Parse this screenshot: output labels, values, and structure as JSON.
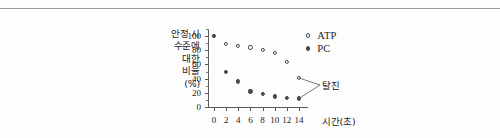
{
  "figure": {
    "y_axis_caption_lines": [
      "안정 시",
      "수준에",
      "대한",
      "비율",
      "(%)"
    ],
    "x_axis_caption": "시간(초)",
    "annotation": "탈진"
  },
  "legend": {
    "position": "top-right",
    "entries": [
      {
        "label": "ATP",
        "marker": "open-circle"
      },
      {
        "label": "PC",
        "marker": "filled-circle"
      }
    ]
  },
  "chart_data": {
    "type": "scatter",
    "title": "",
    "subtitle": "",
    "xlabel": "시간(초)",
    "ylabel": "안정 시 수준에 대한 비율 (%)",
    "xlim": [
      -1,
      15.5
    ],
    "ylim": [
      0,
      110
    ],
    "xticks": [
      0,
      2,
      4,
      6,
      8,
      10,
      12,
      14
    ],
    "xtick_labels": [
      "0",
      "2",
      "4",
      "6",
      "8",
      "10",
      "12",
      "14"
    ],
    "yticks": [
      0,
      20,
      40,
      60,
      80,
      100
    ],
    "ytick_labels": [
      "0",
      "20",
      "40",
      "60",
      "80",
      "100"
    ],
    "y_minor_ticks": [
      10,
      30,
      50,
      70,
      90,
      110
    ],
    "grid": false,
    "x": [
      0,
      2,
      4,
      6,
      8,
      10,
      12,
      14
    ],
    "series": [
      {
        "name": "ATP",
        "marker": "open-circle",
        "color": "#4a4a4a",
        "values": [
          100,
          89,
          86,
          84,
          81,
          76,
          64,
          41
        ]
      },
      {
        "name": "PC",
        "marker": "filled-circle",
        "color": "#4a4a4a",
        "values": [
          100,
          50,
          36,
          22,
          18,
          15,
          13,
          12
        ]
      }
    ],
    "annotations": [
      {
        "text": "탈진",
        "points": [
          {
            "series": "ATP",
            "x": 14,
            "y": 41
          },
          {
            "series": "PC",
            "x": 14,
            "y": 12
          }
        ]
      }
    ]
  },
  "colors": {
    "ink": "#2b2b2b",
    "axis": "#5a5a5a",
    "marker": "#4a4a4a",
    "rule": "#9a9a9a",
    "background": "#fdfdfd"
  }
}
